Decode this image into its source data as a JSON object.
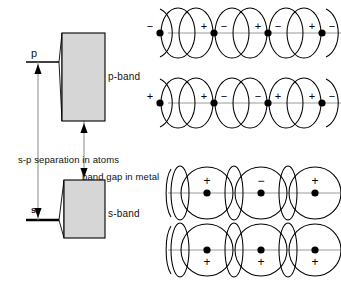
{
  "figure": {
    "title_labels": {
      "p_level": "p",
      "s_level": "s",
      "p_band": "p-band",
      "s_band": "s-band",
      "sp_separation": "s-p separation  in atoms",
      "band_gap": "band gap  in metal"
    },
    "colors": {
      "band_fill": "#d6d6d6",
      "stroke": "#000000",
      "axis_line": "#8a8a8a",
      "thin_line": "#9a9a9a"
    },
    "bands": [
      {
        "name": "p-band",
        "x": 62,
        "y": 33,
        "width": 43,
        "height": 88
      },
      {
        "name": "s-band",
        "x": 64,
        "y": 180,
        "width": 41,
        "height": 58
      }
    ],
    "orbital_rows": [
      {
        "name": "p-band-row-1",
        "kind": "p",
        "y": 33,
        "signs": [
          "+",
          "−",
          "+",
          "−",
          "+",
          "−",
          "+",
          "−"
        ],
        "description": "alternating plus minus pairs about each nucleus"
      },
      {
        "name": "p-band-row-2",
        "kind": "p",
        "y": 103,
        "signs": [
          "+",
          "−",
          "−",
          "+",
          "+",
          "−",
          "−",
          "+"
        ],
        "description": "paired alternation of plus minus about each nucleus"
      },
      {
        "name": "s-band-row-1",
        "kind": "s",
        "y": 193,
        "signs": [
          "+",
          "−",
          "+",
          "−"
        ],
        "sign_position": "above",
        "description": "alternating sign s orbitals, signs above nuclei"
      },
      {
        "name": "s-band-row-2",
        "kind": "s",
        "y": 250,
        "signs": [
          "+",
          "+",
          "+",
          "+"
        ],
        "sign_position": "below",
        "description": "all positive s orbitals, signs below nuclei"
      }
    ]
  }
}
